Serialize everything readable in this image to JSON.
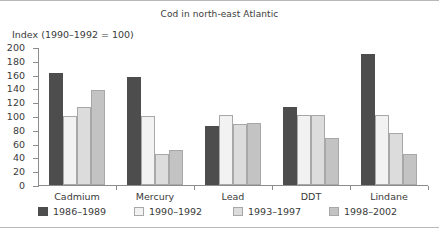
{
  "chart_data": {
    "type": "bar",
    "title": "Cod in north-east Atlantic",
    "ylabel": "Index (1990–1992 = 100)",
    "xlabel": "",
    "ylim": [
      0,
      200
    ],
    "yticks": [
      0,
      20,
      40,
      60,
      80,
      100,
      120,
      140,
      160,
      180,
      200
    ],
    "ytick_labels": [
      "0",
      "20",
      "40",
      "60",
      "80",
      "100",
      "120",
      "140",
      "160",
      "180",
      "200"
    ],
    "grid": false,
    "legend_position": "bottom",
    "categories": [
      "Cadmium",
      "Mercury",
      "Lead",
      "DDT",
      "Lindane"
    ],
    "series": [
      {
        "name": "1986–1989",
        "color": "#4d4d4d",
        "values": [
          162,
          156,
          86,
          113,
          190
        ]
      },
      {
        "name": "1990–1992",
        "color": "#f2f2f2",
        "values": [
          100,
          100,
          101,
          101,
          101
        ]
      },
      {
        "name": "1993–1997",
        "color": "#dcdcdc",
        "values": [
          113,
          45,
          88,
          101,
          76
        ]
      },
      {
        "name": "1998–2002",
        "color": "#c3c3c3",
        "values": [
          138,
          51,
          90,
          68,
          45
        ]
      }
    ]
  }
}
